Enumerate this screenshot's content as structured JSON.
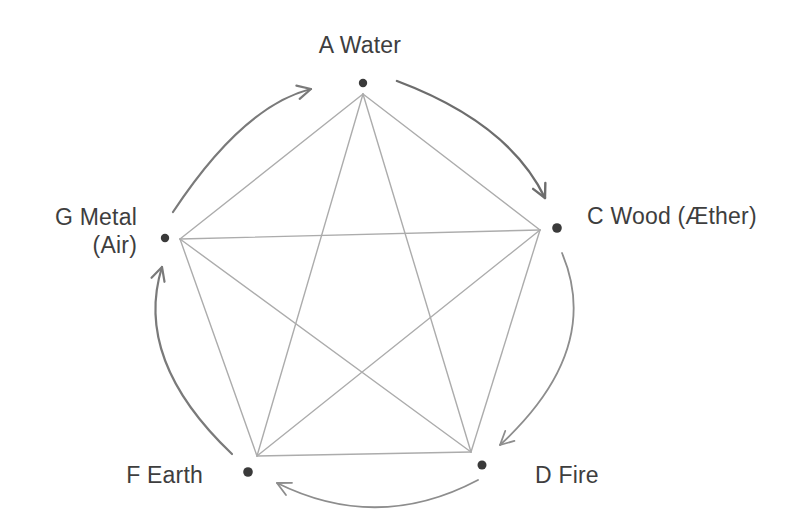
{
  "diagram": {
    "background": "#ffffff",
    "colors": {
      "edge": "#acacac",
      "dot": "#3a3a3a",
      "label": "#3e3e3e"
    },
    "nodes": [
      {
        "id": "water",
        "label": "A Water",
        "dot": [
          363,
          83
        ],
        "vertex": [
          363,
          94
        ],
        "dot_radius": 4.2
      },
      {
        "id": "wood",
        "label": "C Wood (Æther)",
        "dot": [
          557,
          228
        ],
        "vertex": [
          540,
          230
        ],
        "dot_radius": 4.8
      },
      {
        "id": "fire",
        "label": "D Fire",
        "dot": [
          482,
          465
        ],
        "vertex": [
          471,
          452
        ],
        "dot_radius": 4.5
      },
      {
        "id": "earth",
        "label": "F Earth",
        "dot": [
          248,
          472
        ],
        "vertex": [
          257,
          456
        ],
        "dot_radius": 4.8
      },
      {
        "id": "metal",
        "label": "G Metal",
        "label_line2": "(Air)",
        "dot": [
          165,
          238
        ],
        "vertex": [
          180,
          239
        ],
        "dot_radius": 4.2
      }
    ],
    "edges": [
      [
        "water",
        "wood"
      ],
      [
        "wood",
        "fire"
      ],
      [
        "fire",
        "earth"
      ],
      [
        "earth",
        "metal"
      ],
      [
        "metal",
        "water"
      ],
      [
        "water",
        "fire"
      ],
      [
        "water",
        "earth"
      ],
      [
        "wood",
        "earth"
      ],
      [
        "wood",
        "metal"
      ],
      [
        "fire",
        "metal"
      ]
    ],
    "cycle_arrows": [
      {
        "from_id": "water",
        "to_id": "wood",
        "from": [
          397,
          81
        ],
        "ctrl": [
          509,
          123
        ],
        "to": [
          545,
          198
        ],
        "color": "#6d6d6d",
        "width": 2.4
      },
      {
        "from_id": "wood",
        "to_id": "fire",
        "from": [
          562,
          253
        ],
        "ctrl": [
          603,
          350
        ],
        "to": [
          500,
          445
        ],
        "color": "#8d8d8d",
        "width": 1.8
      },
      {
        "from_id": "fire",
        "to_id": "earth",
        "from": [
          478,
          480
        ],
        "ctrl": [
          378,
          533
        ],
        "to": [
          277,
          483
        ],
        "color": "#8d8d8d",
        "width": 1.8
      },
      {
        "from_id": "earth",
        "to_id": "metal",
        "from": [
          232,
          454
        ],
        "ctrl": [
          133,
          360
        ],
        "to": [
          162,
          267
        ],
        "color": "#7a7a7a",
        "width": 2.2
      },
      {
        "from_id": "metal",
        "to_id": "water",
        "from": [
          173,
          212
        ],
        "ctrl": [
          243,
          106
        ],
        "to": [
          311,
          89
        ],
        "color": "#7a7a7a",
        "width": 2.2
      }
    ],
    "arrowhead": {
      "length": 15,
      "half_angle_rad": 0.47
    }
  }
}
